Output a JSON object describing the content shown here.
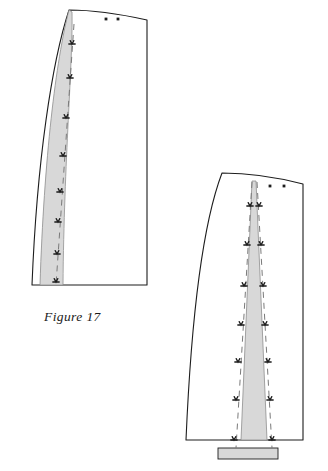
{
  "page": {
    "background_color": "#ffffff",
    "width": 328,
    "height": 471,
    "kind": "sewing-pattern-illustration"
  },
  "caption": {
    "text": "Figure 17",
    "x": 44,
    "y": 321
  },
  "style": {
    "outline_color": "#1d1d1d",
    "outline_width": 1.1,
    "shade_fill": "#d8d8d8",
    "shade_stroke": "#8e8e8e",
    "dash_color": "#7a7a7a",
    "marker_color": "#1d1d1d",
    "dot_color": "#1d1d1d"
  },
  "figures": [
    {
      "id": "figure-left",
      "name": "pattern-piece-left",
      "label": "Figure 17",
      "outline_path": "M 69 10 C 52 62 37 160 32 285 L 147 285 L 147 20 C 120 14 92 10 69 10 Z",
      "shaded_dart": {
        "name": "dart-wedge-left",
        "path": "M 69 10 C 56 60 44 158 40 285 L 63 285 C 64 160 73 62 72 12 Z"
      },
      "dashed_lines": [
        {
          "name": "dart-foldline-left",
          "x1": 74,
          "y1": 24,
          "x2": 56,
          "y2": 285
        }
      ],
      "markers": [
        {
          "x": 72,
          "y": 44
        },
        {
          "x": 70,
          "y": 78
        },
        {
          "x": 66,
          "y": 118
        },
        {
          "x": 63,
          "y": 156
        },
        {
          "x": 60,
          "y": 192
        },
        {
          "x": 58,
          "y": 222
        },
        {
          "x": 57,
          "y": 254
        },
        {
          "x": 56,
          "y": 282
        }
      ],
      "dots": [
        {
          "x": 106,
          "y": 19
        },
        {
          "x": 118,
          "y": 19
        }
      ]
    },
    {
      "id": "figure-right",
      "name": "pattern-piece-right",
      "label": "",
      "outline_path": "M 222 173 C 206 215 192 300 186 440 L 303 440 L 303 184 C 276 177 246 173 222 173 Z",
      "shaded_dart": {
        "name": "dart-wedge-right",
        "path": "M 252 181 L 256 181 L 267 440 L 241 440 Z"
      },
      "base_tab": {
        "name": "dart-base-tab",
        "x": 218,
        "y": 448,
        "width": 60,
        "height": 11
      },
      "dashed_lines": [
        {
          "name": "dart-leg-left-right",
          "x1": 252,
          "y1": 182,
          "x2": 236,
          "y2": 448
        },
        {
          "name": "dart-leg-right-right",
          "x1": 257,
          "y1": 182,
          "x2": 272,
          "y2": 448
        }
      ],
      "markers": [
        {
          "x": 250,
          "y": 206
        },
        {
          "x": 247,
          "y": 245
        },
        {
          "x": 244,
          "y": 286
        },
        {
          "x": 241,
          "y": 325
        },
        {
          "x": 238,
          "y": 362
        },
        {
          "x": 236,
          "y": 400
        },
        {
          "x": 234,
          "y": 440
        },
        {
          "x": 259,
          "y": 206
        },
        {
          "x": 261,
          "y": 245
        },
        {
          "x": 263,
          "y": 286
        },
        {
          "x": 265,
          "y": 325
        },
        {
          "x": 268,
          "y": 362
        },
        {
          "x": 270,
          "y": 400
        },
        {
          "x": 272,
          "y": 440
        }
      ],
      "dots": [
        {
          "x": 270,
          "y": 186
        },
        {
          "x": 284,
          "y": 186
        }
      ]
    }
  ]
}
